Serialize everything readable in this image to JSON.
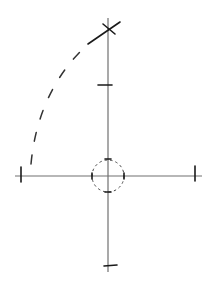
{
  "diagram": {
    "description": "Hand-drawn style coordinate axes with a small dashed circle at the origin, tick marks at the axis ends, a cross mark at the top of the vertical axis, and a dashed arc sweeping from the left end of the horizontal axis to the top cross.",
    "colors": {
      "axis": "#707070",
      "stroke": "#1a1a1a",
      "dashed": "#333333",
      "background": "#ffffff"
    },
    "origin": {
      "x": 108,
      "y": 176
    },
    "vertical_axis": {
      "x": 108,
      "y1": 18,
      "y2": 272
    },
    "horizontal_axis": {
      "y": 176,
      "x1": 15,
      "x2": 202
    },
    "center_circle": {
      "cx": 108,
      "cy": 176,
      "r": 16,
      "style": "dashed"
    },
    "ticks": [
      {
        "name": "left-end-tick",
        "x1": 21,
        "y1": 167,
        "x2": 21,
        "y2": 182
      },
      {
        "name": "right-end-tick",
        "x1": 195,
        "y1": 166,
        "x2": 195,
        "y2": 181
      },
      {
        "name": "top-mid-tick",
        "x1": 98,
        "y1": 85,
        "x2": 112,
        "y2": 85
      },
      {
        "name": "bottom-end-tick",
        "x1": 104,
        "y1": 266,
        "x2": 117,
        "y2": 265
      },
      {
        "name": "circle-top-tick",
        "x1": 105,
        "y1": 159,
        "x2": 111,
        "y2": 159
      },
      {
        "name": "circle-bottom-tick",
        "x1": 105,
        "y1": 192,
        "x2": 111,
        "y2": 192
      },
      {
        "name": "circle-left-tick",
        "x1": 92,
        "y1": 173,
        "x2": 92,
        "y2": 179
      },
      {
        "name": "circle-right-tick",
        "x1": 124,
        "y1": 173,
        "x2": 124,
        "y2": 179
      }
    ],
    "cross_mark": {
      "center": {
        "x": 108,
        "y": 29
      },
      "short_stroke": {
        "x1": 103,
        "y1": 24,
        "x2": 115,
        "y2": 34
      },
      "long_stroke": {
        "x1": 88,
        "y1": 44,
        "x2": 120,
        "y2": 22
      }
    },
    "dashed_arc": {
      "path": "M 31 164 Q 38 90 88 44",
      "dasharray": "9 14"
    }
  }
}
